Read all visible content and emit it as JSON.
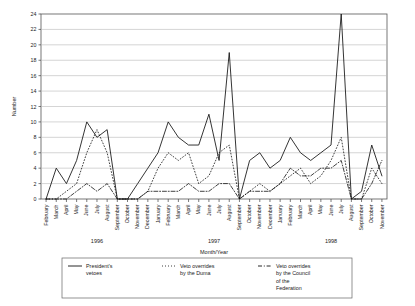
{
  "chart_data": {
    "type": "line",
    "title": "",
    "xlabel": "Month/Year",
    "ylabel": "Number",
    "ylim": [
      0,
      24
    ],
    "ytick_step": 2,
    "yticks": [
      0,
      2,
      4,
      6,
      8,
      10,
      12,
      14,
      16,
      18,
      20,
      22,
      24
    ],
    "grid": "horizontal",
    "legend_position": "bottom",
    "x": [
      "February",
      "March",
      "April",
      "May",
      "June",
      "July",
      "August",
      "September",
      "October",
      "November",
      "December",
      "January",
      "February",
      "March",
      "April",
      "May",
      "June",
      "July",
      "August",
      "September",
      "October",
      "November",
      "December",
      "January",
      "February",
      "March",
      "April",
      "May",
      "June",
      "July",
      "August",
      "September",
      "October",
      "November"
    ],
    "year_groups": [
      {
        "label": "1996",
        "start_index": 0,
        "end_index": 10
      },
      {
        "label": "1997",
        "start_index": 11,
        "end_index": 22
      },
      {
        "label": "1998",
        "start_index": 23,
        "end_index": 33
      }
    ],
    "series": [
      {
        "name": "President's vetoes",
        "style": "solid",
        "color": "#111111",
        "values": [
          0,
          4,
          2,
          5,
          10,
          8,
          9,
          0,
          0,
          2,
          4,
          6,
          10,
          8,
          7,
          7,
          11,
          5,
          19,
          0,
          5,
          6,
          4,
          5,
          8,
          6,
          5,
          6,
          7,
          24,
          0,
          1,
          7,
          3
        ]
      },
      {
        "name": "Veto overrides by the Duma",
        "style": "dotted",
        "color": "#111111",
        "values": [
          0,
          0,
          1,
          2,
          6,
          9,
          6,
          0,
          0,
          0,
          1,
          4,
          6,
          5,
          6,
          2,
          3,
          6,
          7,
          0,
          1,
          2,
          1,
          2,
          3,
          4,
          2,
          3,
          5,
          8,
          0,
          0,
          4,
          2
        ]
      },
      {
        "name": "Veto overrides by the Council of the Federation",
        "style": "dashdot",
        "color": "#111111",
        "values": [
          0,
          0,
          0,
          1,
          2,
          1,
          2,
          0,
          0,
          0,
          1,
          1,
          1,
          1,
          2,
          1,
          1,
          2,
          2,
          0,
          1,
          1,
          1,
          2,
          4,
          3,
          3,
          4,
          4,
          5,
          0,
          0,
          2,
          5
        ]
      }
    ]
  },
  "legend": {
    "items": [
      {
        "label_line1": "President's",
        "label_line2": "vetoes",
        "label_line3": "",
        "label_line4": "",
        "style": "solid"
      },
      {
        "label_line1": "Veto overrides",
        "label_line2": "by the Duma",
        "label_line3": "",
        "label_line4": "",
        "style": "dotted"
      },
      {
        "label_line1": "Veto overrides",
        "label_line2": "by the Council",
        "label_line3": "of the",
        "label_line4": "Federation",
        "style": "dashdot"
      }
    ]
  }
}
